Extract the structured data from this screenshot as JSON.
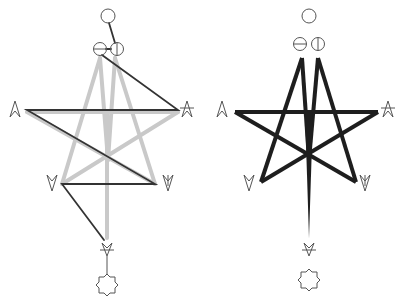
{
  "figure": {
    "colors": {
      "background": "#ffffff",
      "dark_stroke": "#2b2b2b",
      "light_stroke": "#c8c8c8",
      "glyph_stroke": "#555555"
    },
    "panels": [
      {
        "id": "left",
        "label": "path diagram",
        "nodes": [
          {
            "name": "top-circle",
            "glyph": "circle"
          },
          {
            "name": "theta-circle",
            "glyph": "circle-horizontal-bar"
          },
          {
            "name": "phi-circle",
            "glyph": "circle-vertical-bar"
          },
          {
            "name": "left-arrowhead",
            "glyph": "arrowhead-up"
          },
          {
            "name": "right-arrowhead",
            "glyph": "arrowhead-up-barred"
          },
          {
            "name": "lower-left-arrowhead",
            "glyph": "arrowhead-down"
          },
          {
            "name": "lower-right-arrowhead",
            "glyph": "arrowhead-down-barred"
          },
          {
            "name": "bottom-arrowhead",
            "glyph": "arrowhead-down-crossed"
          },
          {
            "name": "bottom-octagram",
            "glyph": "eight-point-star"
          }
        ],
        "edges": "dark path over light gray star"
      },
      {
        "id": "right",
        "label": "star diagram",
        "nodes": [
          {
            "name": "top-circle",
            "glyph": "circle"
          },
          {
            "name": "theta-circle",
            "glyph": "circle-horizontal-bar"
          },
          {
            "name": "phi-circle",
            "glyph": "circle-vertical-bar"
          },
          {
            "name": "left-arrowhead",
            "glyph": "arrowhead-up"
          },
          {
            "name": "right-arrowhead",
            "glyph": "arrowhead-up-barred"
          },
          {
            "name": "lower-left-arrowhead",
            "glyph": "arrowhead-down"
          },
          {
            "name": "lower-right-arrowhead",
            "glyph": "arrowhead-down-barred"
          },
          {
            "name": "bottom-arrowhead",
            "glyph": "arrowhead-down-crossed"
          },
          {
            "name": "bottom-octagram",
            "glyph": "eight-point-star"
          }
        ],
        "edges": "bold black star with tapering spike"
      }
    ]
  }
}
